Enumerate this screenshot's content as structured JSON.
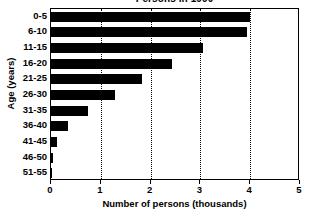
{
  "chart_data": {
    "type": "bar",
    "orientation": "horizontal",
    "title": "Persons in 1990",
    "xlabel": "Number of persons (thousands)",
    "ylabel": "Age (years)",
    "categories": [
      "0-5",
      "6-10",
      "11-15",
      "16-20",
      "21-25",
      "26-30",
      "31-35",
      "36-40",
      "41-45",
      "46-50",
      "51-55"
    ],
    "values": [
      4.0,
      3.93,
      3.05,
      2.42,
      1.82,
      1.28,
      0.74,
      0.35,
      0.13,
      0.04,
      0.02
    ],
    "xlim": [
      0,
      5
    ],
    "xticks": [
      0,
      1,
      2,
      3,
      4,
      5
    ],
    "xtick_labels": [
      "0",
      "1",
      "2",
      "3",
      "4",
      "5"
    ],
    "grid": "vertical-dotted",
    "legend": "none",
    "bar_color": "#000000",
    "background_color": "#ffffff",
    "axis_color": "#000000"
  }
}
